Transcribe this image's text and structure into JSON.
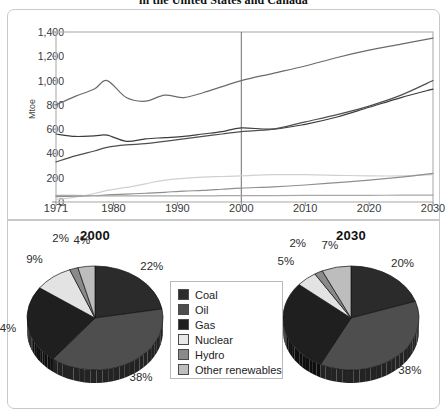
{
  "figure": {
    "title": "in the United States and Canada"
  },
  "chart_data": [
    {
      "type": "line",
      "title": "in the United States and Canada",
      "xlabel": "",
      "ylabel": "Mtoe",
      "xlim": [
        1971,
        2030
      ],
      "ylim": [
        0,
        1400
      ],
      "yticks": [
        "0",
        "200",
        "400",
        "600",
        "800",
        "1,000",
        "1,200",
        "1,400"
      ],
      "ytick_values": [
        0,
        200,
        400,
        600,
        800,
        1000,
        1200,
        1400
      ],
      "xticks": [
        "1971",
        "1980",
        "1990",
        "2000",
        "2010",
        "2020",
        "2030"
      ],
      "xtick_values": [
        1971,
        1980,
        1990,
        2000,
        2010,
        2020,
        2030
      ],
      "grid": false,
      "legend_position": "none",
      "annotation_line_year": 2000,
      "x": [
        1971,
        1974,
        1977,
        1979,
        1982,
        1985,
        1988,
        1991,
        1994,
        1997,
        2000,
        2005,
        2010,
        2015,
        2020,
        2025,
        2030
      ],
      "series": [
        {
          "name": "Oil",
          "color": "#6b6b6b",
          "values": [
            800,
            870,
            930,
            1000,
            860,
            830,
            880,
            860,
            900,
            950,
            1000,
            1060,
            1120,
            1190,
            1250,
            1300,
            1350
          ]
        },
        {
          "name": "Coal",
          "color": "#3c3c3c",
          "values": [
            560,
            540,
            545,
            550,
            500,
            520,
            530,
            540,
            560,
            580,
            610,
            600,
            640,
            700,
            780,
            860,
            930
          ]
        },
        {
          "name": "Gas",
          "color": "#4f4f4f",
          "values": [
            330,
            380,
            420,
            450,
            470,
            480,
            500,
            520,
            540,
            560,
            580,
            600,
            660,
            720,
            790,
            880,
            1000
          ]
        },
        {
          "name": "Nuclear",
          "color": "#d0d0d0",
          "values": [
            20,
            40,
            70,
            95,
            120,
            150,
            180,
            195,
            205,
            210,
            215,
            225,
            225,
            220,
            215,
            215,
            225
          ]
        },
        {
          "name": "Other renewables",
          "color": "#8f8f8f",
          "values": [
            45,
            48,
            52,
            58,
            65,
            72,
            80,
            90,
            95,
            105,
            115,
            125,
            140,
            160,
            180,
            205,
            235
          ]
        },
        {
          "name": "Hydro",
          "color": "#a8a8a8",
          "values": [
            55,
            55,
            52,
            50,
            50,
            50,
            50,
            50,
            50,
            52,
            52,
            53,
            54,
            55,
            55,
            56,
            56
          ]
        }
      ]
    },
    {
      "type": "pie",
      "title": "2000",
      "labels": [
        "Coal",
        "Oil",
        "Gas",
        "Nuclear",
        "Hydro",
        "Other renewables"
      ],
      "values": [
        22,
        38,
        24,
        9,
        2,
        4
      ],
      "display_labels": [
        "22%",
        "38%",
        "24%",
        "9%",
        "2%",
        "4%"
      ],
      "colors": [
        "#2b2b2b",
        "#4e4e4e",
        "#1f1f1f",
        "#e3e3e3",
        "#8a8a8a",
        "#bdbdbd"
      ]
    },
    {
      "type": "pie",
      "title": "2030",
      "labels": [
        "Coal",
        "Oil",
        "Gas",
        "Nuclear",
        "Hydro",
        "Other renewables"
      ],
      "values": [
        20,
        38,
        29,
        5,
        2,
        7
      ],
      "display_labels": [
        "20%",
        "38%",
        "29%",
        "5%",
        "2%",
        "7%"
      ],
      "colors": [
        "#2b2b2b",
        "#4e4e4e",
        "#1f1f1f",
        "#e3e3e3",
        "#8a8a8a",
        "#bdbdbd"
      ]
    }
  ],
  "legend": {
    "items": [
      {
        "label": "Coal",
        "color": "#2b2b2b"
      },
      {
        "label": "Oil",
        "color": "#4e4e4e"
      },
      {
        "label": "Gas",
        "color": "#1f1f1f"
      },
      {
        "label": "Nuclear",
        "color": "#e8e8e8"
      },
      {
        "label": "Hydro",
        "color": "#8a8a8a"
      },
      {
        "label": "Other renewables",
        "color": "#bdbdbd"
      }
    ]
  }
}
